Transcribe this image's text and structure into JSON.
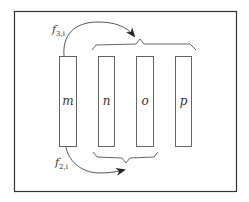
{
  "diagram": {
    "boxes": [
      {
        "id": "m",
        "label": "m"
      },
      {
        "id": "n",
        "label": "n"
      },
      {
        "id": "o",
        "label": "o"
      },
      {
        "id": "p",
        "label": "p"
      }
    ],
    "arrows": [
      {
        "id": "f3",
        "label_base": "f",
        "label_sub": "3,i",
        "from": "m",
        "to": "brace over n, o, p"
      },
      {
        "id": "f2",
        "label_base": "f",
        "label_sub": "2,i",
        "from": "m",
        "to": "brace under n, o"
      }
    ],
    "colors": {
      "stroke": "#444444",
      "frame": "#333333",
      "background": "#ffffff"
    }
  }
}
